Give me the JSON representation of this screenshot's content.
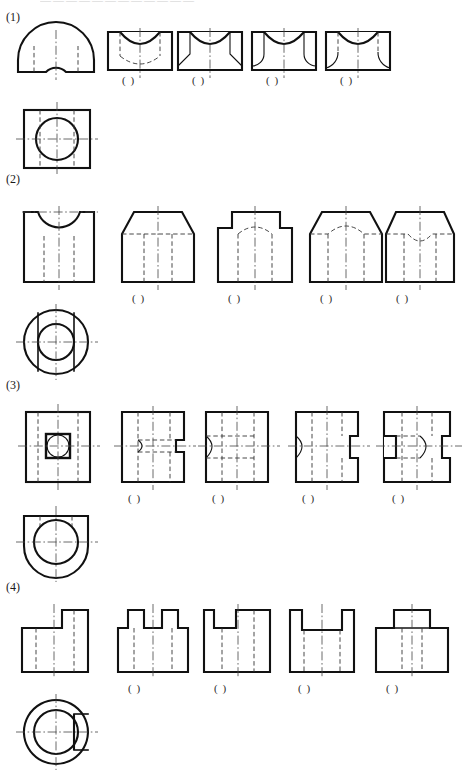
{
  "page": {
    "cut_header": "————————————",
    "width": 464,
    "height": 774,
    "line_colors": {
      "outline": "#111111",
      "hidden": "#333333",
      "center": "#444444",
      "paper": "#ffffff"
    }
  },
  "answer_placeholder": "(  )",
  "exercises": [
    {
      "number": "(1)",
      "front_view_name": "semicircular-block-front-view",
      "top_view_name": "square-with-circle-top-view",
      "options": [
        {
          "label": "(  )",
          "name": "option-1-a"
        },
        {
          "label": "(  )",
          "name": "option-1-b"
        },
        {
          "label": "(  )",
          "name": "option-1-c"
        },
        {
          "label": "(  )",
          "name": "option-1-d"
        }
      ]
    },
    {
      "number": "(2)",
      "front_view_name": "notched-block-front-view",
      "top_view_name": "concentric-circles-top-view",
      "options": [
        {
          "label": "(  )",
          "name": "option-2-a"
        },
        {
          "label": "(  )",
          "name": "option-2-b"
        },
        {
          "label": "(  )",
          "name": "option-2-c"
        },
        {
          "label": "(  )",
          "name": "option-2-d"
        }
      ]
    },
    {
      "number": "(3)",
      "front_view_name": "plate-with-square-hole-front-view",
      "top_view_name": "d-shape-with-circle-top-view",
      "options": [
        {
          "label": "(  )",
          "name": "option-3-a"
        },
        {
          "label": "(  )",
          "name": "option-3-b"
        },
        {
          "label": "(  )",
          "name": "option-3-c"
        },
        {
          "label": "(  )",
          "name": "option-3-d"
        }
      ]
    },
    {
      "number": "(4)",
      "front_view_name": "stepped-block-front-view",
      "top_view_name": "ring-with-notch-top-view",
      "options": [
        {
          "label": "(  )",
          "name": "option-4-a"
        },
        {
          "label": "(  )",
          "name": "option-4-b"
        },
        {
          "label": "(  )",
          "name": "option-4-c"
        },
        {
          "label": "(  )",
          "name": "option-4-d"
        }
      ]
    }
  ]
}
